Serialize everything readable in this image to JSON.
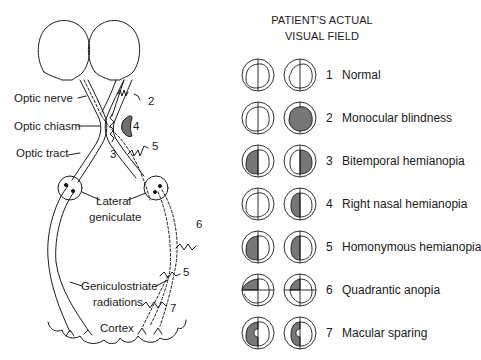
{
  "diagram": {
    "type": "visual pathway lesion diagram",
    "anatomy_labels": {
      "optic_nerve": "Optic nerve",
      "optic_chiasm": "Optic chiasm",
      "optic_tract": "Optic tract",
      "lateral_geniculate_line1": "Lateral",
      "lateral_geniculate_line2": "geniculate",
      "geniculostriate_line1": "Geniculostriate",
      "geniculostriate_line2": "radiations",
      "cortex": "Cortex"
    },
    "lesion_markers": [
      "2",
      "3",
      "4",
      "5",
      "6",
      "5",
      "7"
    ],
    "colors": {
      "line": "#1a1a1a",
      "shade": "#7a7a7a",
      "background": "#ffffff"
    }
  },
  "visual_field_panel": {
    "heading_line1": "PATIENT'S ACTUAL",
    "heading_line2": "VISUAL FIELD",
    "rows": [
      {
        "number": "1",
        "label": "Normal"
      },
      {
        "number": "2",
        "label": "Monocular blindness"
      },
      {
        "number": "3",
        "label": "Bitemporal hemianopia"
      },
      {
        "number": "4",
        "label": "Right nasal hemianopia"
      },
      {
        "number": "5",
        "label": "Homonymous hemianopia"
      },
      {
        "number": "6",
        "label": "Quadrantic anopia"
      },
      {
        "number": "7",
        "label": "Macular sparing"
      }
    ]
  }
}
